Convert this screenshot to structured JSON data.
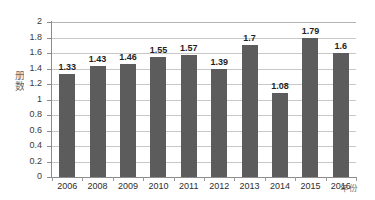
{
  "chart_data": {
    "type": "bar",
    "title": "",
    "subtitle": "",
    "xlabel": "年份",
    "ylabel": "册数",
    "categories": [
      "2006",
      "2008",
      "2009",
      "2010",
      "2011",
      "2012",
      "2013",
      "2014",
      "2015",
      "2016"
    ],
    "values": [
      1.33,
      1.43,
      1.46,
      1.55,
      1.57,
      1.39,
      1.7,
      1.08,
      1.79,
      1.6
    ],
    "data_labels": [
      "1.33",
      "1.43",
      "1.46",
      "1.55",
      "1.57",
      "1.39",
      "1.7",
      "1.08",
      "1.79",
      "1.6"
    ],
    "ylim": [
      0,
      2
    ],
    "ytick_step": 0.2,
    "ytick_labels": [
      "2",
      "1.8",
      "1.6",
      "1.4",
      "1.2",
      "1",
      "0.8",
      "0.6",
      "0.4",
      "0.2",
      "0"
    ],
    "ytick_values": [
      2,
      1.8,
      1.6,
      1.4,
      1.2,
      1,
      0.8,
      0.6,
      0.4,
      0.2,
      0
    ],
    "grid": true,
    "grid_axis": "y",
    "legend": false,
    "legend_position": "none",
    "series": [
      {
        "name": "册数",
        "values": [
          1.33,
          1.43,
          1.46,
          1.55,
          1.57,
          1.39,
          1.7,
          1.08,
          1.79,
          1.6
        ]
      }
    ],
    "colors": {
      "bar": "#5c5c5c",
      "background": "#ffffff",
      "gridline": "#c8c8c8",
      "axis": "#8c8c8c",
      "tick_label": "#2e2e2e",
      "data_label": "#1f1f1f"
    }
  }
}
